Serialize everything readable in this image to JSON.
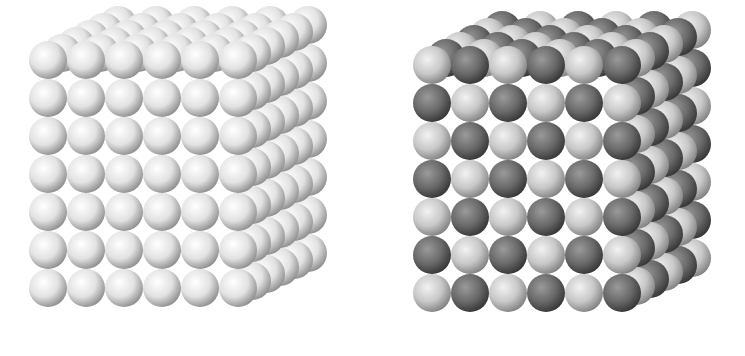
{
  "figure": {
    "panels": [
      {
        "id": "left",
        "description": "cube lattice of identical white spheres",
        "front_cols": 6,
        "front_rows": 7,
        "depth_layers": 6,
        "origin_x": 48,
        "origin_y": 60,
        "spacing_x": 38,
        "spacing_y": 38,
        "depth_dx": 14,
        "depth_dy": -7,
        "radius": 19,
        "colors": {
          "light": "#ffffff",
          "mid": "#e2e2e2",
          "dark": "#8a8a8a"
        },
        "pattern": "uniform"
      },
      {
        "id": "right",
        "description": "cube lattice of alternating light and dark gray spheres",
        "front_cols": 6,
        "front_rows": 7,
        "depth_layers": 6,
        "origin_x": 60,
        "origin_y": 65,
        "spacing_x": 38,
        "spacing_y": 38,
        "depth_dx": 14,
        "depth_dy": -7,
        "radius": 19,
        "colors": {
          "light": {
            "light": "#f2f2f2",
            "mid": "#c8c8c8",
            "dark": "#7d7d7d"
          },
          "dark": {
            "light": "#9a9a9a",
            "mid": "#6a6a6a",
            "dark": "#333333"
          }
        },
        "pattern": "alternating"
      }
    ]
  }
}
